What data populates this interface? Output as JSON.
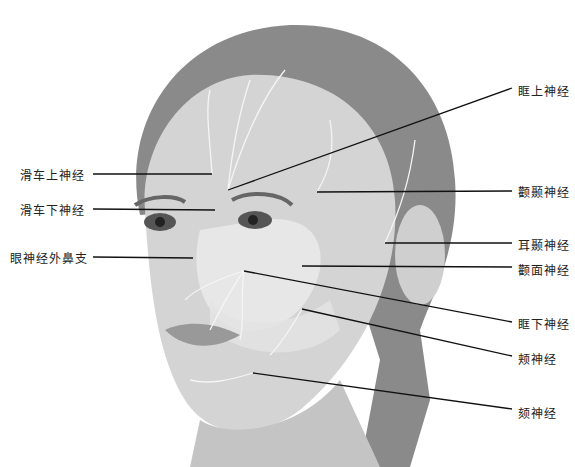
{
  "labels_left": [
    {
      "text": "滑车上神经",
      "x": 20,
      "y": 166
    },
    {
      "text": "滑车下神经",
      "x": 20,
      "y": 201
    },
    {
      "text": "眼神经外鼻支",
      "x": 10,
      "y": 249
    }
  ],
  "labels_right": [
    {
      "text": "眶上神经",
      "x": 518,
      "y": 82
    },
    {
      "text": "颧颞神经",
      "x": 518,
      "y": 183
    },
    {
      "text": "耳颞神经",
      "x": 518,
      "y": 236
    },
    {
      "text": "颧面神经",
      "x": 518,
      "y": 261
    },
    {
      "text": "眶下神经",
      "x": 518,
      "y": 315
    },
    {
      "text": "颊神经",
      "x": 518,
      "y": 350
    },
    {
      "text": "颏神经",
      "x": 518,
      "y": 404
    }
  ],
  "leader_lines": [
    {
      "x1": 93,
      "y1": 174,
      "x2": 212,
      "y2": 174
    },
    {
      "x1": 93,
      "y1": 209,
      "x2": 215,
      "y2": 210
    },
    {
      "x1": 93,
      "y1": 257,
      "x2": 193,
      "y2": 258
    },
    {
      "x1": 512,
      "y1": 88,
      "x2": 228,
      "y2": 190
    },
    {
      "x1": 512,
      "y1": 191,
      "x2": 317,
      "y2": 192
    },
    {
      "x1": 512,
      "y1": 243,
      "x2": 385,
      "y2": 243
    },
    {
      "x1": 512,
      "y1": 267,
      "x2": 302,
      "y2": 266
    },
    {
      "x1": 512,
      "y1": 322,
      "x2": 244,
      "y2": 271
    },
    {
      "x1": 512,
      "y1": 356,
      "x2": 302,
      "y2": 309
    },
    {
      "x1": 512,
      "y1": 409,
      "x2": 253,
      "y2": 373
    }
  ]
}
